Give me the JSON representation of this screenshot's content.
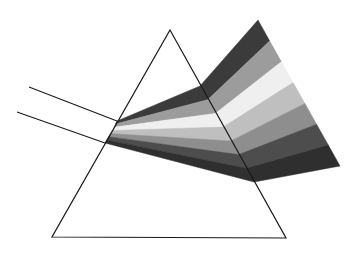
{
  "diagram": {
    "background": "#ffffff",
    "prism": {
      "stroke": "#1a1a1a",
      "apex": [
        170,
        30
      ],
      "base_left": [
        52,
        237
      ],
      "base_right": [
        286,
        238
      ]
    },
    "incident_rays": [
      {
        "from": [
          29,
          87
        ],
        "to": [
          117,
          121
        ]
      },
      {
        "from": [
          17,
          112
        ],
        "to": [
          105,
          143
        ]
      }
    ],
    "bands": [
      {
        "name": "band-1",
        "color": "#3b3b3b"
      },
      {
        "name": "band-2",
        "color": "#9c9c9c"
      },
      {
        "name": "band-3",
        "color": "#efefef"
      },
      {
        "name": "band-4",
        "color": "#bfbfbf"
      },
      {
        "name": "band-5",
        "color": "#8e8e8e"
      },
      {
        "name": "band-6",
        "color": "#4d4d4d"
      },
      {
        "name": "band-7",
        "color": "#2f2f2f"
      }
    ]
  }
}
